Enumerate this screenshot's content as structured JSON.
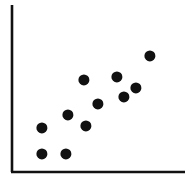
{
  "chart_data": {
    "type": "scatter",
    "title": "",
    "subtitle": "",
    "xlabel": "",
    "ylabel": "",
    "xlim": [
      0,
      100
    ],
    "ylim": [
      0,
      100
    ],
    "grid": false,
    "legend": null,
    "xticks": [],
    "yticks": [],
    "annotations": [],
    "marker": {
      "shape": "circle",
      "color": "#111111",
      "radius_px": 5.6,
      "count": 11
    },
    "axis_style": {
      "color": "#111111",
      "width_px": 2.6,
      "spines": [
        "left",
        "bottom"
      ]
    },
    "series": [
      {
        "name": "series-1",
        "color": "#111111",
        "points": [
          {
            "x": 18.0,
            "y": 12.0,
            "px": 42,
            "py": 154
          },
          {
            "x": 32.0,
            "y": 12.0,
            "px": 66,
            "py": 154
          },
          {
            "x": 18.0,
            "y": 28.0,
            "px": 42,
            "py": 128
          },
          {
            "x": 33.0,
            "y": 36.0,
            "px": 68,
            "py": 115
          },
          {
            "x": 44.0,
            "y": 29.0,
            "px": 86,
            "py": 126
          },
          {
            "x": 43.0,
            "y": 58.0,
            "px": 84,
            "py": 80
          },
          {
            "x": 52.0,
            "y": 43.0,
            "px": 98,
            "py": 104
          },
          {
            "x": 63.0,
            "y": 60.0,
            "px": 117,
            "py": 77
          },
          {
            "x": 67.0,
            "y": 48.0,
            "px": 124,
            "py": 97
          },
          {
            "x": 75.0,
            "y": 53.0,
            "px": 136,
            "py": 88
          },
          {
            "x": 84.0,
            "y": 74.0,
            "px": 150,
            "py": 56
          }
        ]
      }
    ]
  },
  "figure": {
    "width_px": 185,
    "height_px": 185,
    "background": "#ffffff",
    "accessible_description": "Scatter plot with eleven black circular markers showing a positive trend, drawn on left and bottom axis lines with no tick labels."
  },
  "axes_geometry": {
    "y_axis": {
      "x": 12,
      "y_top": 5,
      "y_bottom": 172
    },
    "x_axis": {
      "y": 172,
      "x_left": 11,
      "x_right": 185
    }
  }
}
